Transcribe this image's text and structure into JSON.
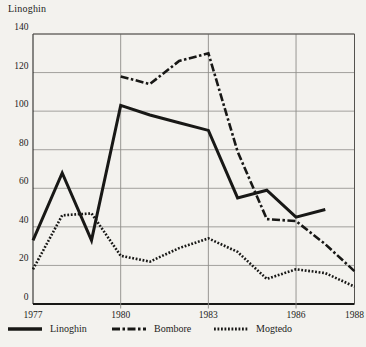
{
  "title": "Linoghin",
  "colors": {
    "line": "#181816",
    "grid": "#8d8c88",
    "axis": "#181816",
    "background": "#f3f2ee"
  },
  "chart_data": {
    "type": "line",
    "title": "Linoghin",
    "xlabel": "",
    "ylabel": "",
    "x_range": [
      1977,
      1988
    ],
    "y_range": [
      0,
      140
    ],
    "y_ticks": [
      0,
      20,
      40,
      60,
      80,
      100,
      120,
      140
    ],
    "x_ticks": [
      1977,
      1980,
      1983,
      1986,
      1988
    ],
    "x_gridlines": [
      1980,
      1983,
      1986
    ],
    "grid": true,
    "legend_position": "bottom",
    "series": [
      {
        "name": "Linoghin",
        "style": "solid",
        "points": [
          [
            1977,
            33
          ],
          [
            1978,
            68
          ],
          [
            1979,
            33
          ],
          [
            1980,
            103
          ],
          [
            1981,
            98
          ],
          [
            1982,
            94
          ],
          [
            1983,
            90
          ],
          [
            1984,
            55
          ],
          [
            1985,
            59
          ],
          [
            1986,
            45
          ],
          [
            1987,
            49
          ]
        ]
      },
      {
        "name": "Bombore",
        "style": "dashdot",
        "points": [
          [
            1980,
            118
          ],
          [
            1981,
            114
          ],
          [
            1982,
            126
          ],
          [
            1983,
            130
          ],
          [
            1984,
            79
          ],
          [
            1985,
            44
          ],
          [
            1986,
            43
          ],
          [
            1987,
            31
          ],
          [
            1988,
            17
          ]
        ]
      },
      {
        "name": "Mogtedo",
        "style": "dotted",
        "points": [
          [
            1977,
            18
          ],
          [
            1978,
            46
          ],
          [
            1979,
            47
          ],
          [
            1980,
            25
          ],
          [
            1981,
            22
          ],
          [
            1982,
            29
          ],
          [
            1983,
            34
          ],
          [
            1984,
            27
          ],
          [
            1985,
            13
          ],
          [
            1986,
            18
          ],
          [
            1987,
            16
          ],
          [
            1988,
            9
          ]
        ]
      }
    ]
  },
  "legend": [
    {
      "label": "Linoghin",
      "style": "solid"
    },
    {
      "label": "Bombore",
      "style": "dashdot"
    },
    {
      "label": "Mogtedo",
      "style": "dotted"
    }
  ]
}
